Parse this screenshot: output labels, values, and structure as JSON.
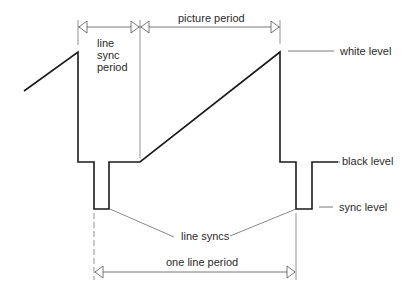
{
  "diagram": {
    "labels": {
      "line_sync_period": [
        "line",
        "sync",
        "period"
      ],
      "picture_period": "picture period",
      "white_level": "white level",
      "black_level": "black level",
      "sync_level": "sync level",
      "line_syncs": "line syncs",
      "one_line_period": "one line period"
    },
    "colors": {
      "waveform": "#1a1a1a",
      "annotation": "#555555",
      "text": "#2a2a2a",
      "background": "#ffffff"
    },
    "levels": {
      "white_y": 52,
      "black_y": 162,
      "sync_y": 209
    }
  }
}
